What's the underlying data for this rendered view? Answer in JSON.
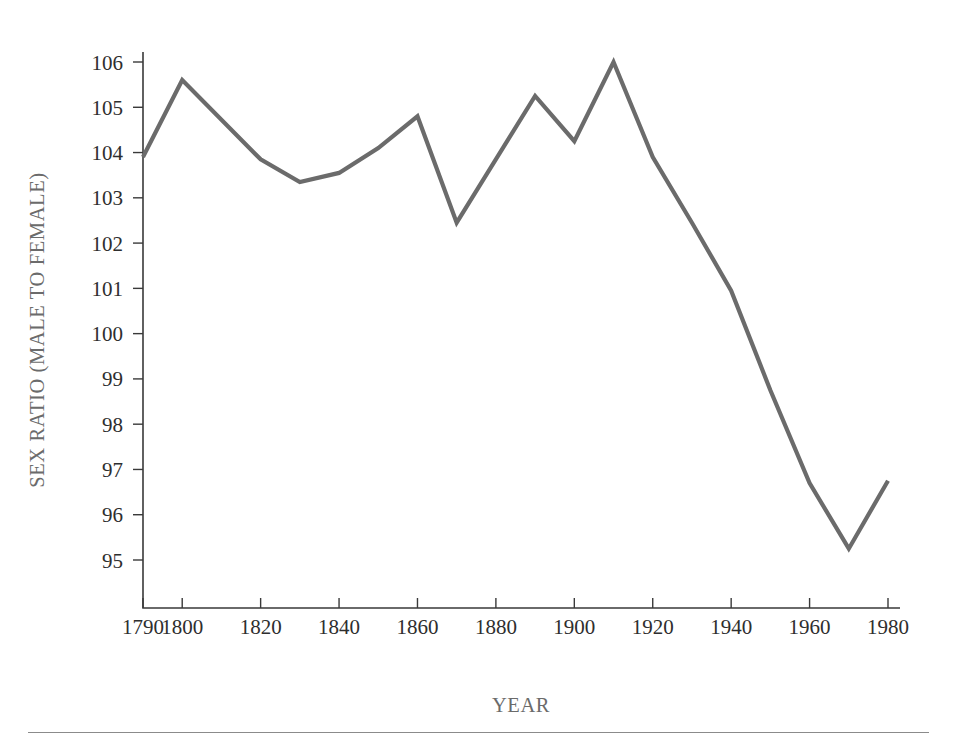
{
  "figure": {
    "background_color": "#ffffff",
    "line_color": "#6b6b6b",
    "axis_color": "#3a3a3a",
    "label_color": "#6b6b6b"
  },
  "axes": {
    "x_title": "YEAR",
    "y_title": "SEX RATIO (MALE TO FEMALE)",
    "y_ticks": [
      "106",
      "105",
      "104",
      "103",
      "102",
      "101",
      "100",
      "99",
      "98",
      "97",
      "96",
      "95"
    ],
    "x_ticks": [
      "1790",
      "1800",
      "1820",
      "1840",
      "1860",
      "1880",
      "1900",
      "1920",
      "1940",
      "1960",
      "1980"
    ]
  },
  "footer": {
    "rule_visible": "true"
  },
  "chart_data": {
    "type": "line",
    "title": "",
    "subtitle": "",
    "xlabel": "YEAR",
    "ylabel": "SEX RATIO (MALE TO FEMALE)",
    "xlim": [
      1790,
      1980
    ],
    "ylim": [
      95,
      106
    ],
    "grid": false,
    "legend": false,
    "legend_position": "none",
    "x_tick_values": [
      1790,
      1800,
      1820,
      1840,
      1860,
      1880,
      1900,
      1920,
      1940,
      1960,
      1980
    ],
    "y_tick_values": [
      95,
      96,
      97,
      98,
      99,
      100,
      101,
      102,
      103,
      104,
      105,
      106
    ],
    "series": [
      {
        "name": "Sex ratio (males per 100 females)",
        "color": "#6b6b6b",
        "x": [
          1790,
          1800,
          1820,
          1830,
          1840,
          1850,
          1860,
          1870,
          1890,
          1900,
          1910,
          1920,
          1930,
          1940,
          1950,
          1960,
          1970,
          1980
        ],
        "values": [
          103.9,
          105.6,
          103.85,
          103.35,
          103.55,
          104.1,
          104.8,
          102.45,
          105.25,
          104.25,
          106.0,
          103.9,
          102.45,
          100.95,
          98.75,
          96.7,
          95.25,
          96.75
        ]
      }
    ],
    "annotations": []
  }
}
